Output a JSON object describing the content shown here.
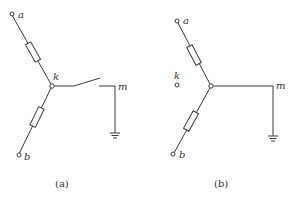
{
  "diagram": {
    "type": "circuit",
    "colors": {
      "line": "#3a3a3a",
      "text": "#333333",
      "background": "#ffffff"
    },
    "panels": [
      {
        "id": "a",
        "caption": "(a)",
        "labels": {
          "a": "a",
          "b": "b",
          "k": "k",
          "m": "m"
        },
        "components": [
          "resistor a-k",
          "resistor k-b",
          "open switch k-m",
          "ground at m"
        ]
      },
      {
        "id": "b",
        "caption": "(b)",
        "labels": {
          "a": "a",
          "b": "b",
          "k": "k",
          "m": "m"
        },
        "components": [
          "resistor a-center",
          "resistor center-b",
          "wire center-m",
          "ground at m",
          "isolated terminal k"
        ]
      }
    ]
  }
}
